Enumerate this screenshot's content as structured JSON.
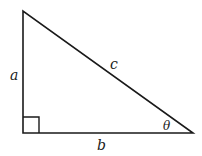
{
  "diagram": {
    "type": "right-triangle",
    "vertices": {
      "top": [
        23,
        11
      ],
      "right_angle": [
        23,
        133
      ],
      "acute": [
        193,
        133
      ]
    },
    "labels": {
      "a": "a",
      "b": "b",
      "c": "c",
      "theta": "θ"
    },
    "stroke_color": "#1a1a1a",
    "right_angle_marker": true
  }
}
